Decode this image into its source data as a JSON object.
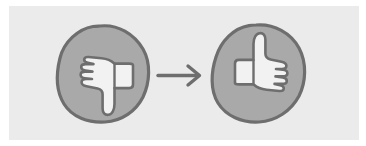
{
  "figure": {
    "panel_background": "#ebebeb",
    "page_background": "#ffffff"
  },
  "colors": {
    "blob_fill": "#a9a9a9",
    "blob_outline": "#6e6e6e",
    "hand_fill": "#f2f2f2",
    "hand_outline": "#6e6e6e",
    "arrow": "#6e6e6e"
  },
  "items": {
    "before": {
      "name": "thumbs-down",
      "label": "",
      "blob": {
        "center_x": 103,
        "center_y": 74,
        "width": 90,
        "height": 97
      }
    },
    "arrow": {
      "name": "right-arrow",
      "label": "",
      "x_start": 158,
      "x_end": 200,
      "y": 75
    },
    "after": {
      "name": "thumbs-up",
      "label": "",
      "blob": {
        "center_x": 258,
        "center_y": 73,
        "width": 93,
        "height": 97
      }
    }
  }
}
